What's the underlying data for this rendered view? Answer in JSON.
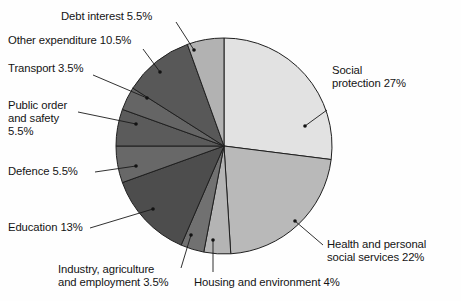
{
  "figure": {
    "kind": "pie-chart",
    "background_color": "#fefefe",
    "outline_color": "#1a1a1a"
  },
  "labels": {
    "debt_interest": "Debt interest 5.5%",
    "other_expenditure": "Other expenditure 10.5%",
    "transport": "Transport 3.5%",
    "public_order_line1": "Public order",
    "public_order_line2": "and safety",
    "public_order_line3": "5.5%",
    "defence": "Defence 5.5%",
    "education": "Education 13%",
    "industry_line1": "Industry, agriculture",
    "industry_line2": "and employment 3.5%",
    "housing": "Housing and environment 4%",
    "health_line1": "Health and personal",
    "health_line2": "social services 22%",
    "social_line1": "Social",
    "social_line2": "protection 27%"
  },
  "chart_data": {
    "type": "pie",
    "title": "",
    "total_percent": 100,
    "start_angle_deg": 0,
    "direction": "clockwise",
    "legend_position": "callout-labels",
    "grid": false,
    "categories": [
      "Social protection",
      "Health and personal social services",
      "Housing and environment",
      "Industry, agriculture and employment",
      "Education",
      "Defence",
      "Public order and safety",
      "Transport",
      "Other expenditure",
      "Debt interest"
    ],
    "values": [
      27,
      22,
      4,
      3.5,
      13,
      5.5,
      5.5,
      3.5,
      10.5,
      5.5
    ],
    "unit": "%",
    "slices": [
      {
        "label": "Social protection",
        "value": 27,
        "value_text": "27%",
        "color": "#e2e2e2"
      },
      {
        "label": "Health and personal social services",
        "value": 22,
        "value_text": "22%",
        "color": "#b9b9b9"
      },
      {
        "label": "Housing and environment",
        "value": 4,
        "value_text": "4%",
        "color": "#b4b4b4"
      },
      {
        "label": "Industry, agriculture and employment",
        "value": 3.5,
        "value_text": "3.5%",
        "color": "#717171"
      },
      {
        "label": "Education",
        "value": 13,
        "value_text": "13%",
        "color": "#4d4d4d"
      },
      {
        "label": "Defence",
        "value": 5.5,
        "value_text": "5.5%",
        "color": "#686868"
      },
      {
        "label": "Public order and safety",
        "value": 5.5,
        "value_text": "5.5%",
        "color": "#5b5b5b"
      },
      {
        "label": "Transport",
        "value": 3.5,
        "value_text": "3.5%",
        "color": "#656565"
      },
      {
        "label": "Other expenditure",
        "value": 10.5,
        "value_text": "10.5%",
        "color": "#585858"
      },
      {
        "label": "Debt interest",
        "value": 5.5,
        "value_text": "5.5%",
        "color": "#b2b2b2"
      }
    ]
  }
}
